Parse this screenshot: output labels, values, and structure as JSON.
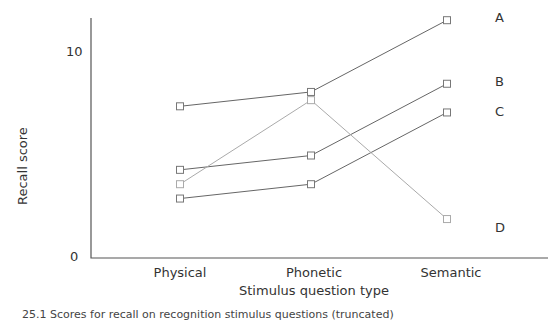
{
  "chart_data": {
    "type": "line",
    "title": "",
    "xlabel": "Stimulus question type",
    "ylabel": "Recall score",
    "categories": [
      "Physical",
      "Phonetic",
      "Semantic"
    ],
    "ylim": [
      0,
      12
    ],
    "yticks": [
      0,
      10
    ],
    "grid": false,
    "legend_position": "right (direct labels at line ends)",
    "series": [
      {
        "name": "A",
        "values": [
          7.4,
          8.1,
          11.6
        ]
      },
      {
        "name": "B",
        "values": [
          4.3,
          5.0,
          8.5
        ]
      },
      {
        "name": "C",
        "values": [
          2.9,
          3.6,
          7.1
        ]
      },
      {
        "name": "D",
        "values": [
          3.6,
          7.7,
          1.9
        ]
      }
    ],
    "caption": "25.1 Scores for recall on recognition stimulus questions (truncated)"
  },
  "axis": {
    "y_tick_0": "0",
    "y_tick_10": "10"
  }
}
